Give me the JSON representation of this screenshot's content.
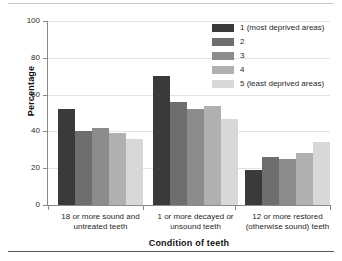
{
  "chart_data": {
    "type": "bar",
    "title": "",
    "xlabel": "Condition of teeth",
    "ylabel": "Percentage",
    "ylim": [
      0,
      100
    ],
    "yticks": [
      0,
      20,
      40,
      60,
      80,
      100
    ],
    "grid": true,
    "legend_position": "top-right",
    "categories": [
      "18 or more sound and untreated teeth",
      "1 or more decayed or unsound teeth",
      "12 or more restored (otherwise sound) teeth"
    ],
    "category_lines": [
      [
        "18 or more sound and",
        "untreated teeth"
      ],
      [
        "1 or more decayed or",
        "unsound teeth"
      ],
      [
        "12 or more restored",
        "(otherwise sound) teeth"
      ]
    ],
    "series": [
      {
        "name": "1 (most deprived areas)",
        "color": "#3a3a3a",
        "values": [
          52,
          70,
          19
        ]
      },
      {
        "name": "2",
        "color": "#6e6e6e",
        "values": [
          40,
          56,
          26
        ]
      },
      {
        "name": "3",
        "color": "#8c8c8c",
        "values": [
          42,
          52,
          25
        ]
      },
      {
        "name": "4",
        "color": "#b0b0b0",
        "values": [
          39,
          54,
          28
        ]
      },
      {
        "name": "5 (least deprived areas)",
        "color": "#d8d8d8",
        "values": [
          36,
          47,
          34
        ]
      }
    ]
  }
}
